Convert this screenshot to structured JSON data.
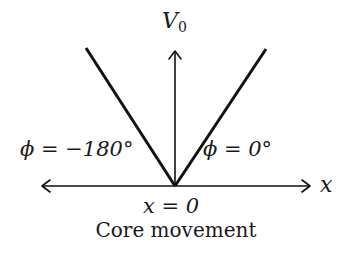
{
  "diagram": {
    "title": "Core movement",
    "vertical_axis": {
      "label": "V",
      "subscript": "0"
    },
    "horizontal_axis": {
      "label": "x"
    },
    "origin_label": "x = 0",
    "branches": [
      {
        "side": "left",
        "label": "ϕ = −180°"
      },
      {
        "side": "right",
        "label": "ϕ = 0°"
      }
    ],
    "colors": {
      "stroke": "#111111",
      "background": "#ffffff"
    }
  }
}
